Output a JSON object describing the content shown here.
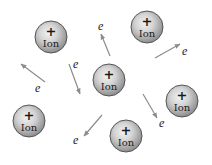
{
  "diagram": {
    "colors": {
      "ion_fill_light": "#e6e6e6",
      "ion_fill_dark": "#9a9a9a",
      "ion_stroke": "#555555",
      "arrow": "#8c8c8c",
      "text": "#1a1a1a"
    },
    "ions": [
      {
        "id": "ion-1",
        "cx": 51,
        "cy": 37,
        "r": 16,
        "sign": "+",
        "label": "Ion"
      },
      {
        "id": "ion-2",
        "cx": 147,
        "cy": 27,
        "r": 16,
        "sign": "+",
        "label": "Ion"
      },
      {
        "id": "ion-3",
        "cx": 109,
        "cy": 80,
        "r": 16,
        "sign": "+",
        "label": "Ion"
      },
      {
        "id": "ion-4",
        "cx": 182,
        "cy": 101,
        "r": 16,
        "sign": "+",
        "label": "Ion"
      },
      {
        "id": "ion-5",
        "cx": 29,
        "cy": 121,
        "r": 16,
        "sign": "+",
        "label": "Ion"
      },
      {
        "id": "ion-6",
        "cx": 126,
        "cy": 136,
        "r": 16,
        "sign": "+",
        "label": "Ion"
      }
    ],
    "electrons": [
      {
        "id": "e-1",
        "label": "e",
        "lx": 98,
        "ly": 30,
        "x1": 110,
        "y1": 56,
        "x2": 101,
        "y2": 34
      },
      {
        "id": "e-2",
        "label": "e",
        "lx": 35,
        "ly": 92,
        "x1": 45,
        "y1": 82,
        "x2": 21,
        "y2": 64
      },
      {
        "id": "e-3",
        "label": "e",
        "lx": 73,
        "ly": 68,
        "x1": 69,
        "y1": 64,
        "x2": 80,
        "y2": 94
      },
      {
        "id": "e-4",
        "label": "e",
        "lx": 182,
        "ly": 55,
        "x1": 155,
        "y1": 58,
        "x2": 180,
        "y2": 44
      },
      {
        "id": "e-5",
        "label": "e",
        "lx": 159,
        "ly": 127,
        "x1": 143,
        "y1": 94,
        "x2": 157,
        "y2": 118
      },
      {
        "id": "e-6",
        "label": "e",
        "lx": 73,
        "ly": 144,
        "x1": 102,
        "y1": 115,
        "x2": 84,
        "y2": 136
      }
    ]
  }
}
